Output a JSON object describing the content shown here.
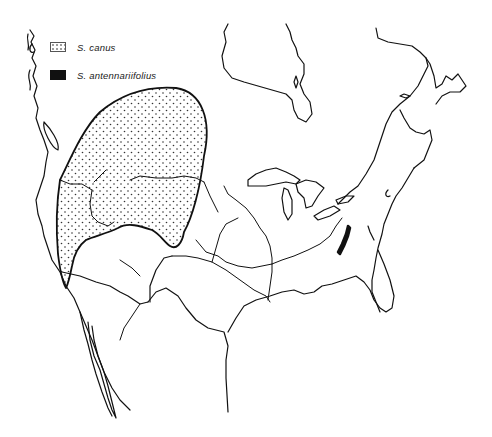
{
  "map": {
    "region": "North America (United States and southern Canada)",
    "line_color": "#111111",
    "background": "#ffffff"
  },
  "legend": {
    "items": [
      {
        "label": "S. canus",
        "pattern": "stippled"
      },
      {
        "label": "S. antennariifolius",
        "pattern": "solid-black"
      }
    ]
  }
}
